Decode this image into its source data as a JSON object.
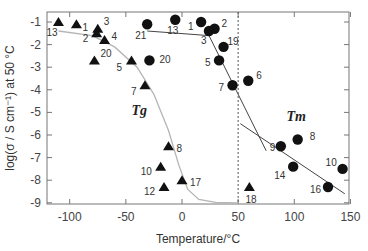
{
  "chart_data": {
    "type": "scatter",
    "title": "",
    "xlabel": "Temperature/°C",
    "ylabel": "log(σ / S cm⁻¹) at 50 °C",
    "xlim": [
      -120,
      150
    ],
    "ylim": [
      -9,
      -0.5
    ],
    "xticks": [
      -100,
      -50,
      0,
      50,
      100,
      150
    ],
    "yticks": [
      -1,
      -2,
      -3,
      -4,
      -5,
      -6,
      -7,
      -8,
      -9
    ],
    "grid": false,
    "legend": null,
    "annotations": [
      {
        "text": "Tg",
        "x": -45,
        "y": -5.1
      },
      {
        "text": "Tm",
        "x": 93,
        "y": -5.4
      },
      {
        "text": "vertical dashed line at 50 °C",
        "x": 50
      }
    ],
    "series": [
      {
        "name": "Tg",
        "marker": "triangle",
        "points": [
          {
            "label": "13",
            "x": -110,
            "y": -1.0
          },
          {
            "label": "1",
            "x": -94,
            "y": -1.1
          },
          {
            "label": "3",
            "x": -75,
            "y": -1.3
          },
          {
            "label": "2",
            "x": -76,
            "y": -1.5
          },
          {
            "label": "4",
            "x": -69,
            "y": -1.8
          },
          {
            "label": "20",
            "x": -78,
            "y": -2.7
          },
          {
            "label": "5",
            "x": -45,
            "y": -2.7
          },
          {
            "label": "7",
            "x": -33,
            "y": -3.8
          },
          {
            "label": "8",
            "x": -12,
            "y": -6.5
          },
          {
            "label": "10",
            "x": -19,
            "y": -7.4
          },
          {
            "label": "12",
            "x": -16,
            "y": -8.3
          },
          {
            "label": "17",
            "x": 0,
            "y": -8.0
          },
          {
            "label": "18",
            "x": 60,
            "y": -8.3
          }
        ]
      },
      {
        "name": "Tm",
        "marker": "circle",
        "points": [
          {
            "label": "21",
            "x": -31,
            "y": -1.1
          },
          {
            "label": "13",
            "x": -6,
            "y": -0.9
          },
          {
            "label": "20",
            "x": -29,
            "y": -2.7
          },
          {
            "label": "1",
            "x": 17,
            "y": -1.0
          },
          {
            "label": "2",
            "x": 29,
            "y": -1.3
          },
          {
            "label": "3",
            "x": 24,
            "y": -1.4
          },
          {
            "label": "19",
            "x": 37,
            "y": -2.1
          },
          {
            "label": "5",
            "x": 33,
            "y": -2.7
          },
          {
            "label": "6",
            "x": 59,
            "y": -3.6
          },
          {
            "label": "7",
            "x": 45,
            "y": -3.8
          },
          {
            "label": "9",
            "x": 88,
            "y": -6.5
          },
          {
            "label": "8",
            "x": 103,
            "y": -6.2
          },
          {
            "label": "14",
            "x": 99,
            "y": -7.4
          },
          {
            "label": "10",
            "x": 143,
            "y": -7.5
          },
          {
            "label": "16",
            "x": 130,
            "y": -8.3
          }
        ]
      }
    ],
    "lines": [
      {
        "name": "Tg guide curve (gray sigmoid)",
        "points": [
          [
            -110,
            -1.4
          ],
          [
            -80,
            -1.6
          ],
          [
            -60,
            -2.1
          ],
          [
            -40,
            -3.0
          ],
          [
            -25,
            -4.2
          ],
          [
            -12,
            -5.8
          ],
          [
            -3,
            -7.3
          ],
          [
            5,
            -8.4
          ],
          [
            15,
            -8.85
          ],
          [
            30,
            -8.98
          ],
          [
            50,
            -9.0
          ]
        ]
      },
      {
        "name": "Tm fit segment 1 (flat)",
        "points": [
          [
            -31,
            -1.4
          ],
          [
            24,
            -1.6
          ]
        ]
      },
      {
        "name": "Tm fit segment 2 (steep)",
        "points": [
          [
            24,
            -1.6
          ],
          [
            75,
            -6.7
          ]
        ]
      },
      {
        "name": "Tm fit segment 3 (high-T)",
        "points": [
          [
            52,
            -5.5
          ],
          [
            145,
            -8.6
          ]
        ]
      }
    ]
  }
}
